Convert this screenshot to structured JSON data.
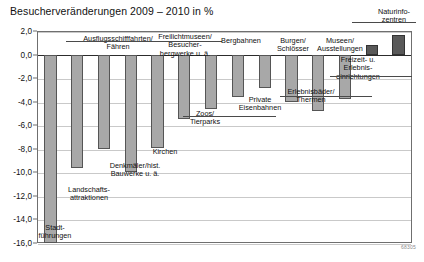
{
  "chart_data": {
    "type": "bar",
    "title": "Besucherveränderungen 2009 – 2010 in %",
    "xlabel": "",
    "ylabel": "",
    "ylim": [
      -16.0,
      2.0
    ],
    "ytick_labels": [
      "2,0",
      "0,0",
      "-2,0",
      "-4,0",
      "-6,0",
      "-8,0",
      "-10,0",
      "-12,0",
      "-14,0",
      "-16,0"
    ],
    "ytick_values": [
      2.0,
      0.0,
      -2.0,
      -4.0,
      -6.0,
      -8.0,
      -10.0,
      -12.0,
      -14.0,
      -16.0
    ],
    "grid": true,
    "legend": "none",
    "categories": [
      "Stadt-\nführungen",
      "Landschafts-\nattraktionen",
      "Ausflugsschifffahrten/\nFähren",
      "Denkmäler/hist.\nBauwerke u. ä.",
      "Kirchen",
      "Freilichtmuseen/\nBesucher-\nbergwerke u. ä.",
      "Zoos/\nTierparks",
      "Bergbahnen",
      "Private\nEisenbahnen",
      "Burgen/\nSchlösser",
      "Erlebnisbäder/\nThermen",
      "Museen/\nAusstellungen",
      "Freizeit- u.\nErlebnis-\neinrichtungen",
      "Naturinfo-\nzentren"
    ],
    "values": [
      -16.0,
      -9.6,
      -8.0,
      -10.0,
      -7.9,
      -5.5,
      -4.6,
      -3.6,
      -2.8,
      -4.0,
      -4.8,
      -3.8,
      0.8,
      1.7
    ],
    "source_note": "68305"
  },
  "series_name": "Besucherveränderung"
}
